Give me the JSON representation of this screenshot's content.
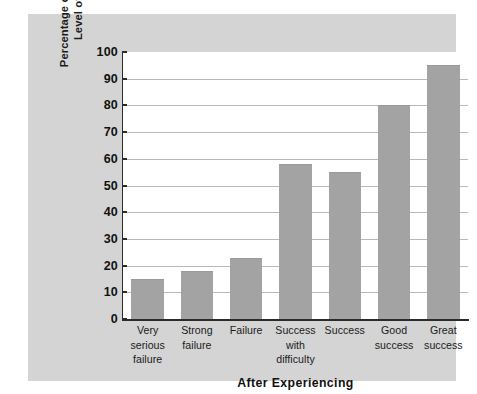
{
  "chart_data": {
    "type": "bar",
    "title": "",
    "xlabel": "After Experiencing",
    "ylabel": "Percentage of Cases Raising Level of Aspiration",
    "ylabel_lines": [
      "Percentage of Cases Raising",
      "Level of Aspiration"
    ],
    "categories": [
      "Very serious failure",
      "Strong failure",
      "Failure",
      "Success with difficulty",
      "Success",
      "Good success",
      "Great success"
    ],
    "category_label_lines": [
      [
        "Very",
        "serious",
        "failure"
      ],
      [
        "Strong",
        "failure"
      ],
      [
        "Failure"
      ],
      [
        "Success",
        "with",
        "difficulty"
      ],
      [
        "Success"
      ],
      [
        "Good",
        "success"
      ],
      [
        "Great",
        "success"
      ]
    ],
    "values": [
      15,
      18,
      23,
      58,
      55,
      80,
      95
    ],
    "ylim": [
      0,
      100
    ],
    "ytick_values": [
      0,
      10,
      20,
      30,
      40,
      50,
      60,
      70,
      80,
      90,
      100
    ],
    "ytick_labels": [
      "0",
      "10",
      "20",
      "30",
      "40",
      "50",
      "60",
      "70",
      "80",
      "90",
      "100"
    ],
    "grid": true,
    "grid_axis": "y",
    "legend": false,
    "legend_position": "none",
    "bar_color": "#a3a3a3",
    "plot_background": "#ffffff",
    "figure_background": "#d4d4d4",
    "axis_color": "#2b2b2b",
    "gridline_color": "#b9b9b9"
  }
}
